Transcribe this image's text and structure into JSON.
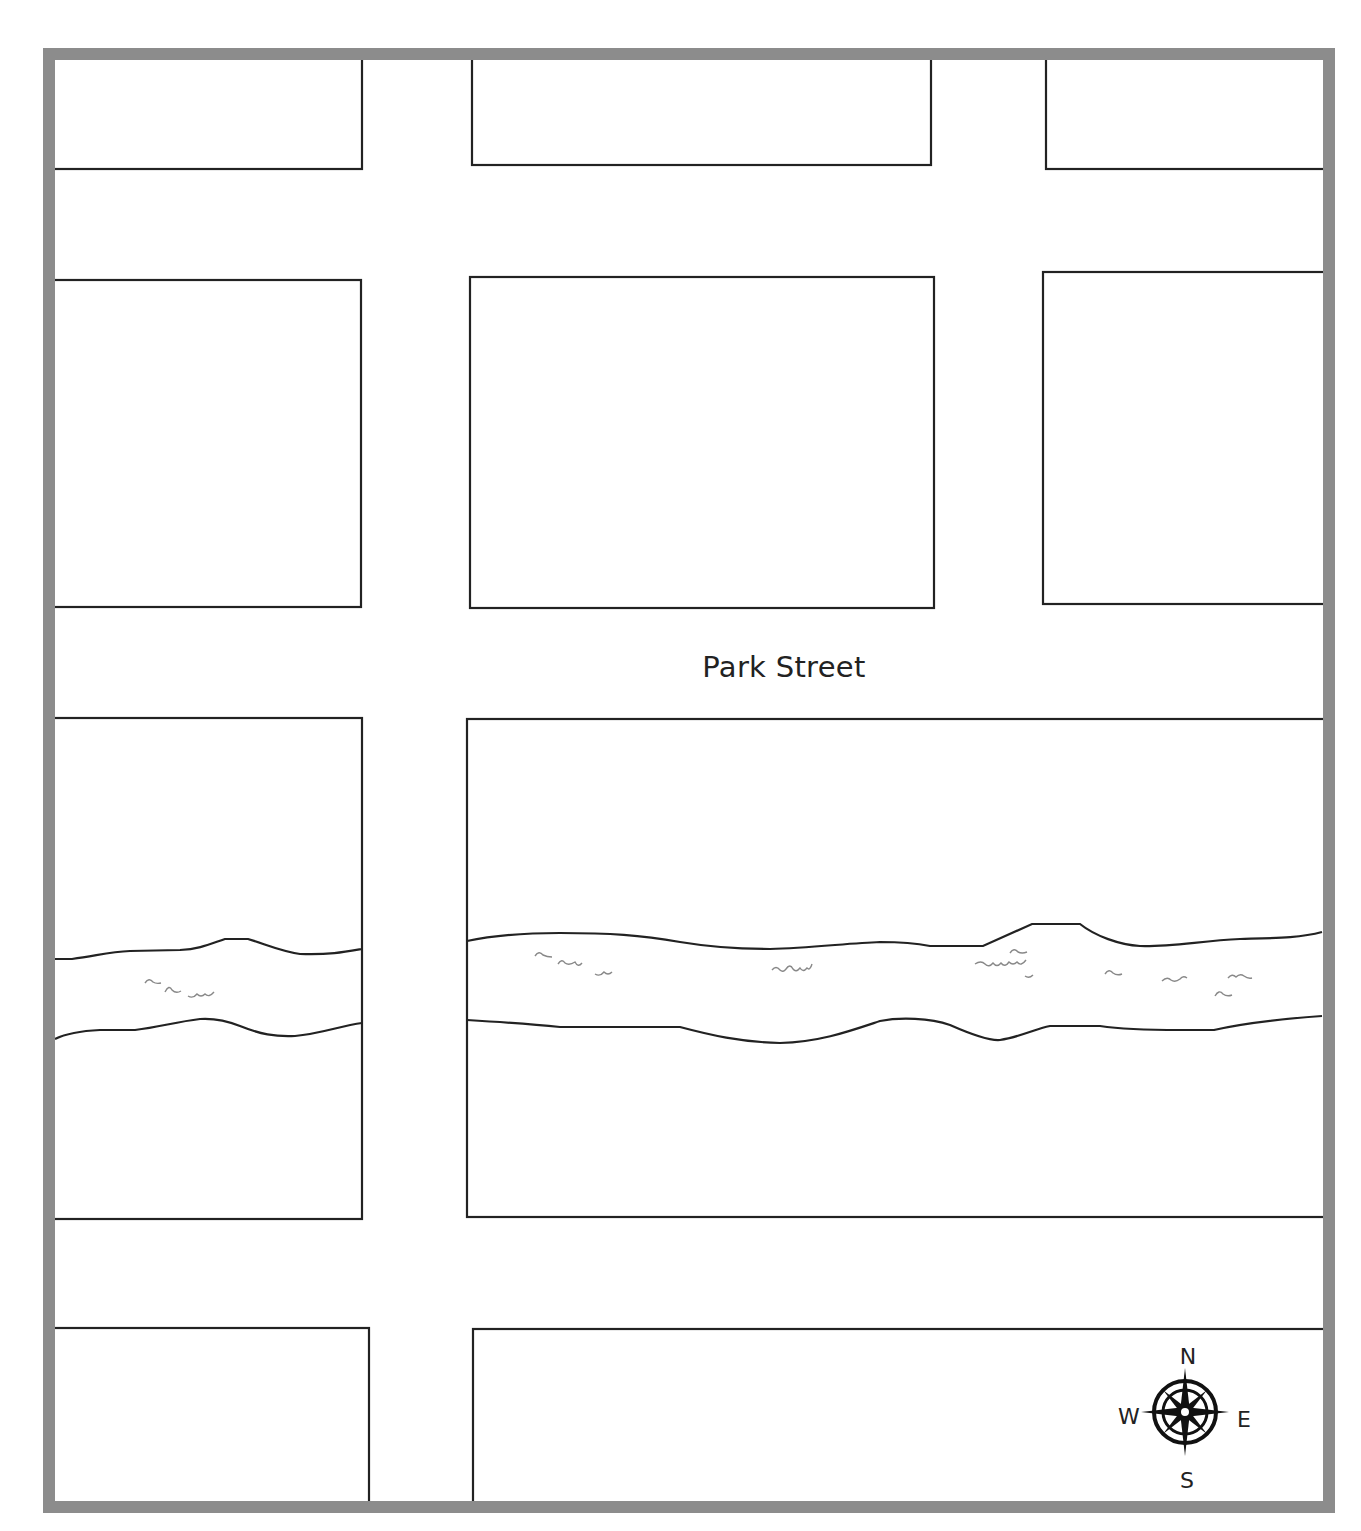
{
  "map": {
    "frame": {
      "border_color": "#8c8c8c",
      "border_width": 12
    },
    "streets": [
      {
        "name": "Park Street",
        "label_x": 784,
        "label_y": 668
      }
    ],
    "blocks": [
      {
        "id": "block-a",
        "x": 55,
        "y": 55,
        "w": 307,
        "h": 114
      },
      {
        "id": "block-b",
        "x": 472,
        "y": 55,
        "w": 459,
        "h": 110
      },
      {
        "id": "block-c",
        "x": 1046,
        "y": 55,
        "w": 290,
        "h": 114
      },
      {
        "id": "block-d",
        "x": 55,
        "y": 280,
        "w": 306,
        "h": 327
      },
      {
        "id": "block-e",
        "x": 470,
        "y": 277,
        "w": 464,
        "h": 331
      },
      {
        "id": "block-f",
        "x": 1043,
        "y": 272,
        "w": 293,
        "h": 332
      },
      {
        "id": "block-g",
        "x": 55,
        "y": 718,
        "w": 307,
        "h": 501
      },
      {
        "id": "block-h",
        "x": 467,
        "y": 719,
        "w": 869,
        "h": 498
      },
      {
        "id": "block-i",
        "x": 55,
        "y": 1328,
        "w": 314,
        "h": 200
      },
      {
        "id": "block-j",
        "x": 473,
        "y": 1329,
        "w": 863,
        "h": 200
      }
    ],
    "river": {
      "name": "river",
      "stroke_color": "#222222",
      "wave_color": "#888888"
    },
    "compass": {
      "icon": "compass-rose-icon",
      "north": "N",
      "south": "S",
      "east": "E",
      "west": "W",
      "center_x": 1185,
      "center_y": 1412
    }
  }
}
